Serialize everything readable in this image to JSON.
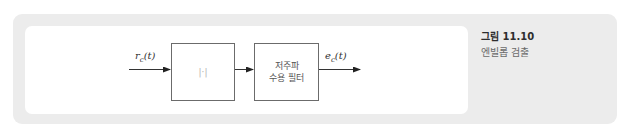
{
  "figure": {
    "number_label": "그림 11.10",
    "caption": "엔빌롭 검출"
  },
  "diagram": {
    "input_signal": {
      "base": "r",
      "sub": "c",
      "arg": "(t)"
    },
    "output_signal": {
      "base": "e",
      "sub": "c",
      "arg": "(t)"
    },
    "blocks": [
      {
        "id": "abs",
        "label": "|·|"
      },
      {
        "id": "lpf",
        "line1": "저주파",
        "line2": "수용 필터"
      }
    ]
  },
  "colors": {
    "panel_gray": "#ececec",
    "inner_white": "#ffffff",
    "line": "#333333",
    "block_border": "#6b6b6b"
  }
}
